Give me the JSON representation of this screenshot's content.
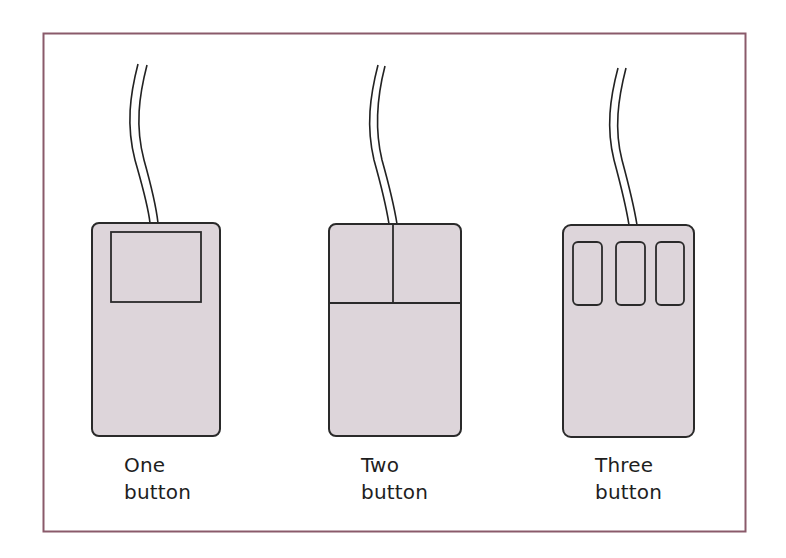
{
  "figure": {
    "frame_color": "#8a5a6a",
    "body_fill": "#ddd5da",
    "outline_color": "#2a2a2a",
    "mice": [
      {
        "id": "one",
        "button_count": 1,
        "label_line1": "One",
        "label_line2": "button"
      },
      {
        "id": "two",
        "button_count": 2,
        "label_line1": "Two",
        "label_line2": "button"
      },
      {
        "id": "three",
        "button_count": 3,
        "label_line1": "Three",
        "label_line2": "button"
      }
    ]
  }
}
